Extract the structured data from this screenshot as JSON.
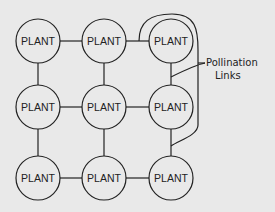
{
  "diagram": {
    "node_label": "PLANT",
    "nodes": [
      {
        "label": "PLANT",
        "row": 0,
        "col": 0
      },
      {
        "label": "PLANT",
        "row": 0,
        "col": 1
      },
      {
        "label": "PLANT",
        "row": 0,
        "col": 2
      },
      {
        "label": "PLANT",
        "row": 1,
        "col": 0
      },
      {
        "label": "PLANT",
        "row": 1,
        "col": 1
      },
      {
        "label": "PLANT",
        "row": 1,
        "col": 2
      },
      {
        "label": "PLANT",
        "row": 2,
        "col": 0
      },
      {
        "label": "PLANT",
        "row": 2,
        "col": 1
      },
      {
        "label": "PLANT",
        "row": 2,
        "col": 2
      }
    ],
    "annotation": {
      "line1": "Pollination",
      "line2": "Links"
    },
    "colors": {
      "background": "#e9e9e9",
      "stroke": "#222222"
    }
  }
}
